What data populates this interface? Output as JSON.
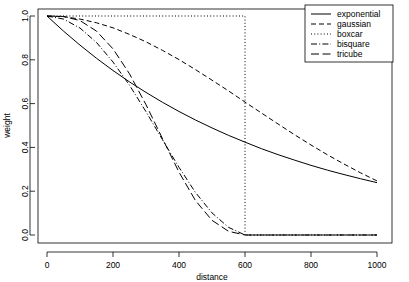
{
  "chart_data": {
    "type": "line",
    "title": "",
    "xlabel": "distance",
    "ylabel": "weight",
    "xlim": [
      0,
      1000
    ],
    "ylim": [
      0.0,
      1.0
    ],
    "xticks": [
      0,
      200,
      400,
      600,
      800,
      1000
    ],
    "yticks": [
      0.0,
      0.2,
      0.4,
      0.6,
      0.8,
      1.0
    ],
    "xtick_labels": [
      "0",
      "200",
      "400",
      "600",
      "800",
      "1000"
    ],
    "ytick_labels": [
      "0.0",
      "0.2",
      "0.4",
      "0.6",
      "0.8",
      "1.0"
    ],
    "grid": false,
    "legend_position": "top-right",
    "bandwidth": 600,
    "x": [
      0,
      50,
      100,
      150,
      200,
      250,
      300,
      350,
      400,
      450,
      500,
      550,
      600,
      650,
      700,
      750,
      800,
      850,
      900,
      950,
      1000
    ],
    "series": [
      {
        "name": "exponential",
        "dash": "solid",
        "color": "#000000",
        "values": [
          1.0,
          0.931,
          0.867,
          0.807,
          0.751,
          0.699,
          0.651,
          0.606,
          0.564,
          0.525,
          0.489,
          0.455,
          0.424,
          0.394,
          0.367,
          0.342,
          0.318,
          0.296,
          0.276,
          0.257,
          0.239
        ]
      },
      {
        "name": "gaussian",
        "dash": "dashed",
        "color": "#000000",
        "values": [
          1.0,
          0.997,
          0.986,
          0.969,
          0.946,
          0.916,
          0.882,
          0.843,
          0.801,
          0.755,
          0.707,
          0.658,
          0.607,
          0.557,
          0.507,
          0.458,
          0.411,
          0.366,
          0.324,
          0.284,
          0.247
        ]
      },
      {
        "name": "boxcar",
        "dash": "dotted",
        "color": "#000000",
        "values": [
          1.0,
          1.0,
          1.0,
          1.0,
          1.0,
          1.0,
          1.0,
          1.0,
          1.0,
          1.0,
          1.0,
          1.0,
          1.0,
          0.0,
          0.0,
          0.0,
          0.0,
          0.0,
          0.0,
          0.0,
          0.0
        ]
      },
      {
        "name": "bisquare",
        "dash": "dashdot",
        "color": "#000000",
        "values": [
          1.0,
          0.986,
          0.945,
          0.879,
          0.79,
          0.684,
          0.563,
          0.435,
          0.309,
          0.194,
          0.101,
          0.035,
          0.0,
          0.0,
          0.0,
          0.0,
          0.0,
          0.0,
          0.0,
          0.0,
          0.0
        ]
      },
      {
        "name": "tricube",
        "dash": "longdash",
        "color": "#000000",
        "values": [
          1.0,
          0.998,
          0.979,
          0.931,
          0.85,
          0.736,
          0.595,
          0.44,
          0.287,
          0.157,
          0.067,
          0.017,
          0.0,
          0.0,
          0.0,
          0.0,
          0.0,
          0.0,
          0.0,
          0.0,
          0.0
        ]
      }
    ]
  },
  "legend": {
    "items": [
      {
        "label": "exponential"
      },
      {
        "label": "gaussian"
      },
      {
        "label": "boxcar"
      },
      {
        "label": "bisquare"
      },
      {
        "label": "tricube"
      }
    ]
  },
  "axes": {
    "x_title": "distance",
    "y_title": "weight"
  }
}
